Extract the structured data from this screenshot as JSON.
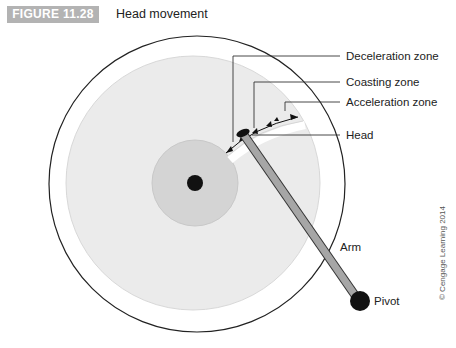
{
  "figure": {
    "number": "FIGURE 11.28",
    "title": "Head movement"
  },
  "labels": {
    "deceleration": "Deceleration zone",
    "coasting": "Coasting zone",
    "acceleration": "Acceleration zone",
    "head": "Head",
    "arm": "Arm",
    "pivot": "Pivot"
  },
  "copyright": "© Cengage Learning 2014",
  "colors": {
    "badge": "#b3b3b3",
    "platter": "#ebebeb",
    "hub": "#d4d4d4",
    "arm": "#a6a6a6",
    "ink": "#111111"
  }
}
